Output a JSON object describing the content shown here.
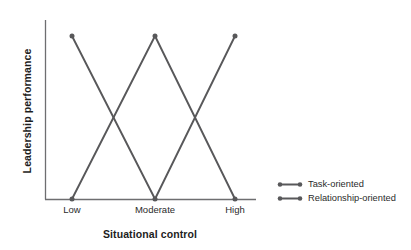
{
  "chart_data": {
    "type": "line",
    "title": "",
    "subtitle": "",
    "xlabel": "Situational control",
    "ylabel": "Leadership performance",
    "categories": [
      "Low",
      "Moderate",
      "High"
    ],
    "xticklabels": [
      "Low",
      "Moderate",
      "High"
    ],
    "yticklabels": [],
    "ylim": [
      0,
      1
    ],
    "xlim": [
      0,
      2
    ],
    "grid": false,
    "legend_position": "right",
    "annotations": [],
    "line_color": "#58585a",
    "marker_color": "#58585a",
    "axis_color": "#6e6e70",
    "background_color": "#ffffff",
    "series": [
      {
        "name": "Task-oriented",
        "values": [
          1,
          0,
          1
        ],
        "color": "#58585a"
      },
      {
        "name": "Relationship-oriented",
        "values": [
          0,
          1,
          0
        ],
        "color": "#58585a"
      }
    ]
  },
  "axes": {
    "y_title": "Leadership performance",
    "x_title": "Situational control",
    "ticks": [
      {
        "label": "Low"
      },
      {
        "label": "Moderate"
      },
      {
        "label": "High"
      }
    ]
  },
  "legend": {
    "entries": [
      {
        "label": "Task-oriented"
      },
      {
        "label": "Relationship-oriented"
      }
    ]
  }
}
